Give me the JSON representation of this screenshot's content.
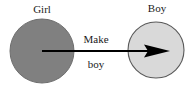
{
  "diagram": {
    "type": "node-edge-diagram",
    "canvas": {
      "width": 194,
      "height": 86,
      "background": "#ffffff"
    },
    "nodes": [
      {
        "id": "girl",
        "label": "Girl",
        "shape": "circle",
        "cx": 42,
        "cy": 51,
        "r": 32,
        "fill": "#808080",
        "stroke": "#6e6e6e",
        "label_x": 42,
        "label_y": 13
      },
      {
        "id": "boy",
        "label": "Boy",
        "shape": "circle",
        "cx": 156,
        "cy": 50,
        "r": 28,
        "fill": "#d9d9d9",
        "stroke": "#595959",
        "label_x": 157,
        "label_y": 12
      }
    ],
    "edges": [
      {
        "id": "make-boy",
        "from": "girl",
        "to": "boy",
        "label_line1": "Make",
        "label_line2": "boy",
        "x1": 42,
        "y1": 51,
        "x2": 170,
        "y2": 51,
        "color": "#000000",
        "width": 2,
        "arrowhead": "solid-triangle",
        "label1_x": 96,
        "label1_y": 43,
        "label2_x": 96,
        "label2_y": 68
      }
    ]
  }
}
